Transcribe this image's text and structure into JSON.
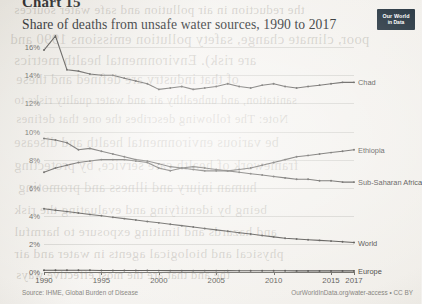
{
  "chart_number": "Chart 15",
  "logo": {
    "line1": "Our World",
    "line2": "in Data"
  },
  "footer": {
    "source": "Source: IHME, Global Burden of Disease",
    "credit": "OurWorldInData.org/water-access • CC BY"
  },
  "bleed_text": [
    {
      "text": "the reduction in air pollution and safe water sources",
      "x": 14,
      "y": 2,
      "size": 13
    },
    {
      "text": "poor, climate change, safety pollution emissions 1990 and",
      "x": 10,
      "y": 31,
      "size": 14.5
    },
    {
      "text": "are risk). Environmental health metrics",
      "x": 14,
      "y": 52,
      "size": 14.5
    },
    {
      "text": "of that industry are defined and these",
      "x": 16,
      "y": 72,
      "size": 14
    },
    {
      "text": "sanitation, and unhealthy air and water quality risks to",
      "x": 14,
      "y": 93,
      "size": 12
    },
    {
      "text": "Note: The following describes the one that defines",
      "x": 16,
      "y": 112,
      "size": 12.5
    },
    {
      "text": "be various environmental health and disease",
      "x": 14,
      "y": 135,
      "size": 14
    },
    {
      "text": "framework of health care service, by protecting",
      "x": 14,
      "y": 158,
      "size": 14
    },
    {
      "text": "human injury and illness and promoting",
      "x": 18,
      "y": 180,
      "size": 14
    },
    {
      "text": "being by identifying and evaluating the risk",
      "x": 14,
      "y": 202,
      "size": 13.5
    },
    {
      "text": "and hazards and limiting exposure to harmful",
      "x": 14,
      "y": 224,
      "size": 13.5
    },
    {
      "text": "physical and biological agents in water and air",
      "x": 14,
      "y": 246,
      "size": 13.5
    },
    {
      "text": "the and that are the most effective ways",
      "x": 16,
      "y": 268,
      "size": 12.5
    }
  ],
  "chart_data": {
    "type": "line",
    "title": "Share of deaths from unsafe water sources, 1990 to 2017",
    "xlabel": "",
    "ylabel": "",
    "xlim": [
      1990,
      2017
    ],
    "ylim": [
      0,
      16.8
    ],
    "grid": true,
    "legend_position": "inline-right",
    "ytick_labels": [
      "0%",
      "2%",
      "4%",
      "6%",
      "8%",
      "10%",
      "12%",
      "14%",
      "16%"
    ],
    "ytick_values": [
      0,
      2,
      4,
      6,
      8,
      10,
      12,
      14,
      16
    ],
    "xtick_labels": [
      "1990",
      "1995",
      "2000",
      "2005",
      "2010",
      "2015",
      "2017"
    ],
    "xtick_values": [
      1990,
      1995,
      2000,
      2005,
      2010,
      2015,
      2017
    ],
    "x": [
      1990,
      1991,
      1992,
      1993,
      1994,
      1995,
      1996,
      1997,
      1998,
      1999,
      2000,
      2001,
      2002,
      2003,
      2004,
      2005,
      2006,
      2007,
      2008,
      2009,
      2010,
      2011,
      2012,
      2013,
      2014,
      2015,
      2016,
      2017
    ],
    "series": [
      {
        "name": "Chad",
        "label": "Chad",
        "values": [
          15.8,
          16.8,
          14.4,
          14.3,
          14.1,
          14.0,
          14.0,
          13.8,
          13.6,
          13.4,
          13.0,
          13.1,
          13.2,
          13.0,
          13.1,
          13.2,
          13.4,
          13.2,
          13.1,
          13.3,
          13.4,
          13.2,
          13.1,
          13.2,
          13.3,
          13.4,
          13.5,
          13.5
        ]
      },
      {
        "name": "Ethiopia",
        "label": "Ethiopia",
        "values": [
          9.5,
          9.4,
          9.2,
          8.7,
          8.8,
          8.6,
          8.4,
          8.2,
          8.0,
          7.9,
          7.7,
          7.5,
          7.4,
          7.3,
          7.2,
          7.2,
          7.2,
          7.3,
          7.4,
          7.6,
          7.8,
          8.0,
          8.2,
          8.3,
          8.4,
          8.5,
          8.6,
          8.7
        ]
      },
      {
        "name": "Sub-Saharan Africa",
        "label": "Sub-Saharan Africa",
        "values": [
          7.1,
          7.4,
          7.6,
          7.8,
          7.9,
          8.0,
          8.0,
          8.0,
          7.9,
          7.8,
          7.4,
          7.2,
          7.4,
          7.5,
          7.4,
          7.3,
          7.2,
          7.1,
          7.0,
          6.9,
          6.8,
          6.7,
          6.6,
          6.6,
          6.5,
          6.5,
          6.4,
          6.4
        ]
      },
      {
        "name": "World",
        "label": "World",
        "values": [
          4.5,
          4.4,
          4.3,
          4.2,
          4.1,
          4.0,
          3.9,
          3.8,
          3.7,
          3.6,
          3.5,
          3.4,
          3.3,
          3.2,
          3.1,
          3.0,
          2.9,
          2.8,
          2.7,
          2.6,
          2.5,
          2.4,
          2.35,
          2.3,
          2.25,
          2.2,
          2.15,
          2.1
        ]
      },
      {
        "name": "Europe",
        "label": "Europe",
        "values": [
          0.12,
          0.12,
          0.12,
          0.12,
          0.12,
          0.11,
          0.11,
          0.11,
          0.11,
          0.11,
          0.1,
          0.1,
          0.1,
          0.1,
          0.1,
          0.1,
          0.1,
          0.09,
          0.09,
          0.09,
          0.09,
          0.09,
          0.08,
          0.08,
          0.08,
          0.08,
          0.08,
          0.08
        ]
      }
    ]
  }
}
